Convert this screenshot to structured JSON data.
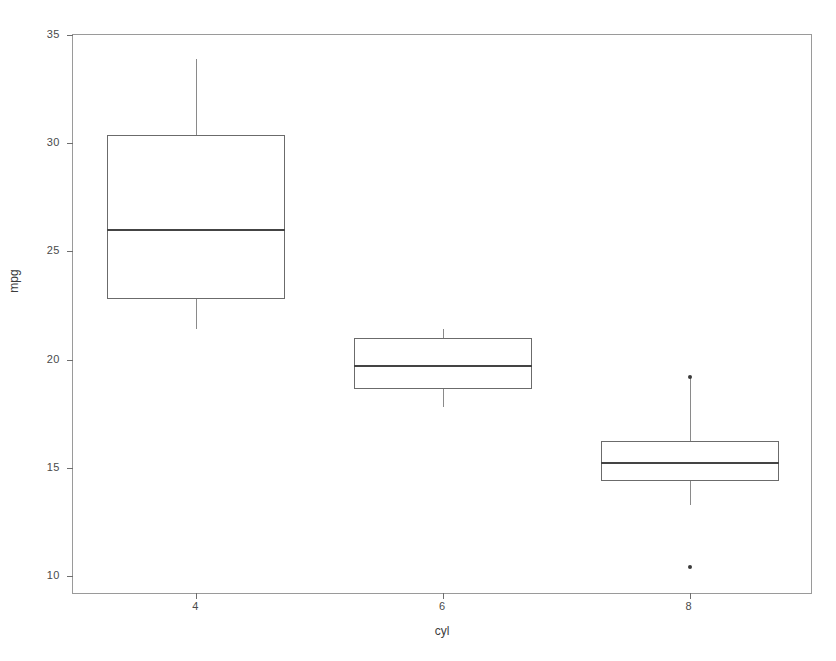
{
  "chart_data": {
    "type": "box",
    "title": "",
    "xlabel": "cyl",
    "ylabel": "mpg",
    "categories": [
      "4",
      "6",
      "8"
    ],
    "ylim": [
      9.0,
      35.0
    ],
    "y_ticks": [
      10,
      15,
      20,
      25,
      30,
      35
    ],
    "x_ticks": [
      "4",
      "6",
      "8"
    ],
    "grid": false,
    "legend": "none",
    "boxes": [
      {
        "category": "4",
        "whisker_low": 21.4,
        "q1": 22.8,
        "median": 26.0,
        "q3": 30.4,
        "whisker_high": 33.9,
        "outliers": []
      },
      {
        "category": "6",
        "whisker_low": 17.8,
        "q1": 18.65,
        "median": 19.7,
        "q3": 21.0,
        "whisker_high": 21.4,
        "outliers": []
      },
      {
        "category": "8",
        "whisker_low": 13.3,
        "q1": 14.4,
        "median": 15.2,
        "q3": 16.25,
        "whisker_high": 19.2,
        "outliers": [
          19.2,
          10.4
        ]
      }
    ]
  },
  "axis": {
    "y_tick_labels": [
      "35",
      "30",
      "25",
      "20",
      "15",
      "10"
    ],
    "x_tick_labels": [
      "4",
      "6",
      "8"
    ],
    "y_title": "mpg",
    "x_title": "cyl"
  },
  "colors": {
    "panel_border": "#9a9a9a",
    "box_stroke": "#6b6b6b",
    "median_stroke": "#444444",
    "whisker_stroke": "#8a8a8a",
    "outlier_fill": "#3a3a3a",
    "tick_text": "#4a4a4a",
    "background": "#ffffff"
  }
}
